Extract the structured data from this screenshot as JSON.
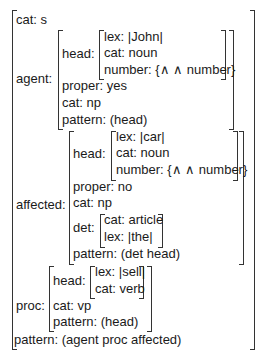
{
  "fs": {
    "cat": "cat: s",
    "agent": {
      "label": "agent:",
      "head_label": "head:",
      "head": [
        "lex: |John|",
        "cat: noun",
        "number: {∧ ∧ number}"
      ],
      "rest": [
        "proper: yes",
        "cat: np",
        "pattern: (head)"
      ]
    },
    "affected": {
      "label": "affected:",
      "head_label": "head:",
      "head": [
        "lex: |car|",
        "cat: noun",
        "number: {∧ ∧ number}"
      ],
      "rest": [
        "proper: no",
        "cat: np"
      ],
      "det_label": "det:",
      "det": [
        "cat: article",
        "lex: |the|"
      ],
      "pattern": "pattern: (det head)"
    },
    "proc": {
      "label": "proc:",
      "head_label": "head:",
      "head": [
        "lex: |sell|",
        "cat: verb"
      ],
      "rest": [
        "cat: vp",
        "pattern: (head)"
      ]
    },
    "pattern": "pattern: (agent proc affected)"
  }
}
